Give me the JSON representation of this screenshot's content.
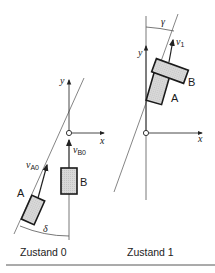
{
  "figure": {
    "colors": {
      "line": "#555555",
      "block_fill": "#d6d6d6",
      "block_stroke": "#1a1a1a",
      "axis": "#333333"
    },
    "panels": [
      {
        "caption": "Zustand 0",
        "axis_x_label": "x",
        "axis_y_label": "y",
        "angle_label": "δ",
        "blocks": [
          {
            "label": "A",
            "velocity_label": "v",
            "velocity_sub": "A0"
          },
          {
            "label": "B",
            "velocity_label": "v",
            "velocity_sub": "B0"
          }
        ]
      },
      {
        "caption": "Zustand 1",
        "axis_x_label": "x",
        "axis_y_label": "y",
        "angle_label": "γ",
        "velocity_label": "v",
        "velocity_sub": "1",
        "blocks": [
          {
            "label": "A"
          },
          {
            "label": "B"
          }
        ]
      }
    ]
  }
}
